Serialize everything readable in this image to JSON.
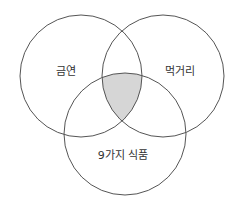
{
  "diagram": {
    "type": "venn",
    "sets": [
      {
        "id": "left",
        "label": "금연"
      },
      {
        "id": "right",
        "label": "먹거리"
      },
      {
        "id": "bottom",
        "label": "9가지 식품"
      }
    ],
    "highlighted_region": "intersection of 금연, 먹거리, and 9가지 식품 (upper-central lens)",
    "colors": {
      "stroke": "#555555",
      "highlight_fill": "#d6d6d6",
      "background": "#ffffff",
      "text": "#333333"
    }
  }
}
